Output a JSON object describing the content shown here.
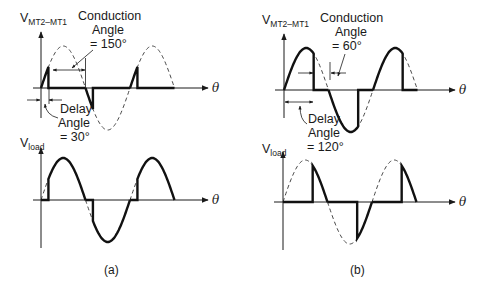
{
  "figure": {
    "panels": [
      {
        "id": "a",
        "caption": "(a)",
        "top": {
          "ylabel_main": "V",
          "ylabel_sub": "MT2–MT1",
          "xlabel": "θ",
          "conduction": {
            "line1": "Conduction",
            "line2": "Angle",
            "line3": "= 150°"
          },
          "delay": {
            "line1": "Delay",
            "line2": "Angle",
            "line3": "= 30°"
          }
        },
        "bottom": {
          "ylabel_main": "V",
          "ylabel_sub": "load",
          "xlabel": "θ"
        }
      },
      {
        "id": "b",
        "caption": "(b)",
        "top": {
          "ylabel_main": "V",
          "ylabel_sub": "MT2–MT1",
          "xlabel": "θ",
          "conduction": {
            "line1": "Conduction",
            "line2": "Angle",
            "line3": "= 60°"
          },
          "delay": {
            "line1": "Delay",
            "line2": "Angle",
            "line3": "= 120°"
          }
        },
        "bottom": {
          "ylabel_main": "V",
          "ylabel_sub": "load",
          "xlabel": "θ"
        }
      }
    ]
  },
  "chart_data": [
    {
      "type": "line",
      "title": "(a) V_MT2-MT1 — triac voltage, delay angle 30°, conduction angle 150°",
      "xlabel": "θ",
      "ylabel": "V_MT2-MT1",
      "delay_angle_deg": 30,
      "conduction_angle_deg": 150,
      "x_range_deg": [
        0,
        540
      ],
      "series": [
        {
          "name": "supply sine (dashed)",
          "style": "dashed"
        },
        {
          "name": "V_MT2-MT1 (solid)",
          "style": "solid",
          "description": "follows sine 0–30° each half-cycle, zero during 30–180° conduction"
        }
      ]
    },
    {
      "type": "line",
      "title": "(a) V_load — delay angle 30°",
      "xlabel": "θ",
      "ylabel": "V_load",
      "delay_angle_deg": 30,
      "x_range_deg": [
        0,
        540
      ],
      "series": [
        {
          "name": "supply sine (dashed)",
          "style": "dashed"
        },
        {
          "name": "V_load (solid)",
          "style": "solid",
          "description": "zero 0–30° each half-cycle, follows sine 30–180°"
        }
      ]
    },
    {
      "type": "line",
      "title": "(b) V_MT2-MT1 — triac voltage, delay angle 120°, conduction angle 60°",
      "xlabel": "θ",
      "ylabel": "V_MT2-MT1",
      "delay_angle_deg": 120,
      "conduction_angle_deg": 60,
      "x_range_deg": [
        0,
        540
      ],
      "series": [
        {
          "name": "supply sine (dashed)",
          "style": "dashed"
        },
        {
          "name": "V_MT2-MT1 (solid)",
          "style": "solid",
          "description": "follows sine 0–120° each half-cycle, zero during 120–180° conduction"
        }
      ]
    },
    {
      "type": "line",
      "title": "(b) V_load — delay angle 120°",
      "xlabel": "θ",
      "ylabel": "V_load",
      "delay_angle_deg": 120,
      "x_range_deg": [
        0,
        540
      ],
      "series": [
        {
          "name": "supply sine (dashed)",
          "style": "dashed"
        },
        {
          "name": "V_load (solid)",
          "style": "solid",
          "description": "zero 0–120° each half-cycle, follows sine 120–180°"
        }
      ]
    }
  ]
}
